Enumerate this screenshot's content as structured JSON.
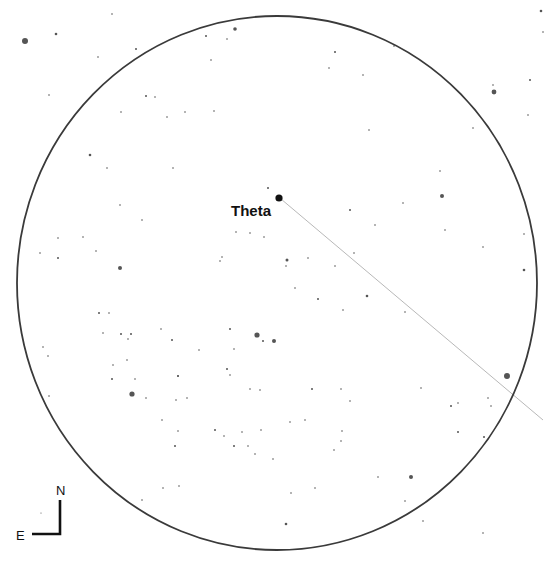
{
  "chart": {
    "background": "#ffffff",
    "field_of_view": {
      "cx": 277,
      "cy": 283,
      "rx": 260,
      "ry": 267,
      "stroke": "#3a3a3a",
      "stroke_width": 1.8
    },
    "path_line": {
      "x1": 281,
      "y1": 199,
      "x2": 543,
      "y2": 420,
      "stroke": "#b8b8b8",
      "stroke_width": 1
    },
    "target": {
      "name": "Theta",
      "x": 279,
      "y": 198,
      "r": 3.6,
      "label_x": 231,
      "label_y": 216,
      "font_size": 15
    },
    "compass": {
      "north_label": "N",
      "east_label": "E",
      "corner_x": 60,
      "corner_y": 534,
      "north_tip_y": 500,
      "east_tip_x": 32,
      "n_label_x": 61,
      "n_label_y": 495,
      "e_label_x": 20,
      "e_label_y": 540
    },
    "star_color": "#555555",
    "stars": [
      {
        "x": 25,
        "y": 41,
        "r": 3.0
      },
      {
        "x": 56,
        "y": 34,
        "r": 1.3
      },
      {
        "x": 235,
        "y": 29,
        "r": 1.8
      },
      {
        "x": 112,
        "y": 14,
        "r": 0.8
      },
      {
        "x": 206,
        "y": 36,
        "r": 1.0
      },
      {
        "x": 227,
        "y": 39,
        "r": 0.8
      },
      {
        "x": 136,
        "y": 49,
        "r": 1.0
      },
      {
        "x": 98,
        "y": 57,
        "r": 0.8
      },
      {
        "x": 211,
        "y": 60,
        "r": 0.8
      },
      {
        "x": 146,
        "y": 96,
        "r": 1.0
      },
      {
        "x": 155,
        "y": 97,
        "r": 0.8
      },
      {
        "x": 185,
        "y": 112,
        "r": 0.8
      },
      {
        "x": 167,
        "y": 117,
        "r": 0.8
      },
      {
        "x": 121,
        "y": 112,
        "r": 0.8
      },
      {
        "x": 214,
        "y": 111,
        "r": 0.8
      },
      {
        "x": 494,
        "y": 92,
        "r": 2.4
      },
      {
        "x": 541,
        "y": 11,
        "r": 1.3
      },
      {
        "x": 543,
        "y": 32,
        "r": 0.8
      },
      {
        "x": 394,
        "y": 46,
        "r": 0.8
      },
      {
        "x": 335,
        "y": 52,
        "r": 1.0
      },
      {
        "x": 329,
        "y": 68,
        "r": 0.8
      },
      {
        "x": 363,
        "y": 75,
        "r": 0.8
      },
      {
        "x": 530,
        "y": 80,
        "r": 1.0
      },
      {
        "x": 493,
        "y": 85,
        "r": 0.8
      },
      {
        "x": 369,
        "y": 130,
        "r": 0.8
      },
      {
        "x": 473,
        "y": 128,
        "r": 0.8
      },
      {
        "x": 528,
        "y": 115,
        "r": 0.8
      },
      {
        "x": 90,
        "y": 155,
        "r": 1.3
      },
      {
        "x": 107,
        "y": 168,
        "r": 0.8
      },
      {
        "x": 173,
        "y": 168,
        "r": 0.8
      },
      {
        "x": 120,
        "y": 205,
        "r": 0.8
      },
      {
        "x": 142,
        "y": 220,
        "r": 0.8
      },
      {
        "x": 58,
        "y": 238,
        "r": 0.8
      },
      {
        "x": 83,
        "y": 237,
        "r": 0.8
      },
      {
        "x": 96,
        "y": 251,
        "r": 0.8
      },
      {
        "x": 58,
        "y": 258,
        "r": 1.0
      },
      {
        "x": 120,
        "y": 268,
        "r": 2.0
      },
      {
        "x": 40,
        "y": 253,
        "r": 0.8
      },
      {
        "x": 442,
        "y": 196,
        "r": 2.0
      },
      {
        "x": 403,
        "y": 203,
        "r": 0.8
      },
      {
        "x": 445,
        "y": 230,
        "r": 0.8
      },
      {
        "x": 483,
        "y": 247,
        "r": 0.8
      },
      {
        "x": 524,
        "y": 270,
        "r": 1.3
      },
      {
        "x": 524,
        "y": 234,
        "r": 0.8
      },
      {
        "x": 440,
        "y": 171,
        "r": 0.8
      },
      {
        "x": 268,
        "y": 188,
        "r": 1.0
      },
      {
        "x": 270,
        "y": 214,
        "r": 0.8
      },
      {
        "x": 250,
        "y": 233,
        "r": 0.8
      },
      {
        "x": 236,
        "y": 232,
        "r": 0.8
      },
      {
        "x": 264,
        "y": 237,
        "r": 0.8
      },
      {
        "x": 222,
        "y": 257,
        "r": 0.8
      },
      {
        "x": 220,
        "y": 261,
        "r": 0.8
      },
      {
        "x": 287,
        "y": 260,
        "r": 1.5
      },
      {
        "x": 286,
        "y": 266,
        "r": 0.8
      },
      {
        "x": 308,
        "y": 258,
        "r": 0.8
      },
      {
        "x": 335,
        "y": 266,
        "r": 0.8
      },
      {
        "x": 350,
        "y": 210,
        "r": 1.0
      },
      {
        "x": 375,
        "y": 225,
        "r": 0.8
      },
      {
        "x": 354,
        "y": 253,
        "r": 0.8
      },
      {
        "x": 295,
        "y": 288,
        "r": 0.8
      },
      {
        "x": 318,
        "y": 299,
        "r": 1.0
      },
      {
        "x": 367,
        "y": 296,
        "r": 1.3
      },
      {
        "x": 343,
        "y": 310,
        "r": 0.8
      },
      {
        "x": 405,
        "y": 312,
        "r": 0.8
      },
      {
        "x": 257,
        "y": 335,
        "r": 2.6
      },
      {
        "x": 263,
        "y": 341,
        "r": 1.0
      },
      {
        "x": 274,
        "y": 341,
        "r": 2.0
      },
      {
        "x": 230,
        "y": 329,
        "r": 1.0
      },
      {
        "x": 234,
        "y": 349,
        "r": 0.8
      },
      {
        "x": 227,
        "y": 369,
        "r": 1.0
      },
      {
        "x": 99,
        "y": 313,
        "r": 1.0
      },
      {
        "x": 109,
        "y": 313,
        "r": 0.8
      },
      {
        "x": 103,
        "y": 333,
        "r": 0.8
      },
      {
        "x": 121,
        "y": 334,
        "r": 1.0
      },
      {
        "x": 131,
        "y": 334,
        "r": 1.0
      },
      {
        "x": 128,
        "y": 339,
        "r": 0.8
      },
      {
        "x": 161,
        "y": 329,
        "r": 0.8
      },
      {
        "x": 172,
        "y": 340,
        "r": 1.0
      },
      {
        "x": 178,
        "y": 376,
        "r": 1.0
      },
      {
        "x": 43,
        "y": 347,
        "r": 0.8
      },
      {
        "x": 48,
        "y": 356,
        "r": 0.8
      },
      {
        "x": 112,
        "y": 379,
        "r": 1.0
      },
      {
        "x": 135,
        "y": 379,
        "r": 0.8
      },
      {
        "x": 199,
        "y": 350,
        "r": 0.8
      },
      {
        "x": 132,
        "y": 394,
        "r": 2.6
      },
      {
        "x": 146,
        "y": 398,
        "r": 0.8
      },
      {
        "x": 49,
        "y": 396,
        "r": 0.8
      },
      {
        "x": 187,
        "y": 398,
        "r": 0.8
      },
      {
        "x": 176,
        "y": 400,
        "r": 0.8
      },
      {
        "x": 162,
        "y": 420,
        "r": 0.8
      },
      {
        "x": 507,
        "y": 376,
        "r": 3.0
      },
      {
        "x": 488,
        "y": 398,
        "r": 0.8
      },
      {
        "x": 451,
        "y": 406,
        "r": 1.0
      },
      {
        "x": 458,
        "y": 403,
        "r": 0.8
      },
      {
        "x": 491,
        "y": 406,
        "r": 0.8
      },
      {
        "x": 458,
        "y": 432,
        "r": 1.0
      },
      {
        "x": 421,
        "y": 388,
        "r": 0.8
      },
      {
        "x": 312,
        "y": 389,
        "r": 1.0
      },
      {
        "x": 230,
        "y": 375,
        "r": 0.8
      },
      {
        "x": 250,
        "y": 389,
        "r": 0.8
      },
      {
        "x": 260,
        "y": 390,
        "r": 0.8
      },
      {
        "x": 341,
        "y": 389,
        "r": 0.8
      },
      {
        "x": 350,
        "y": 401,
        "r": 0.8
      },
      {
        "x": 127,
        "y": 360,
        "r": 0.8
      },
      {
        "x": 113,
        "y": 365,
        "r": 0.8
      },
      {
        "x": 178,
        "y": 376,
        "r": 0.8
      },
      {
        "x": 242,
        "y": 432,
        "r": 0.8
      },
      {
        "x": 261,
        "y": 430,
        "r": 0.8
      },
      {
        "x": 178,
        "y": 431,
        "r": 0.8
      },
      {
        "x": 215,
        "y": 430,
        "r": 1.0
      },
      {
        "x": 341,
        "y": 441,
        "r": 0.8
      },
      {
        "x": 175,
        "y": 446,
        "r": 1.0
      },
      {
        "x": 224,
        "y": 436,
        "r": 0.8
      },
      {
        "x": 234,
        "y": 446,
        "r": 1.0
      },
      {
        "x": 248,
        "y": 446,
        "r": 0.8
      },
      {
        "x": 273,
        "y": 459,
        "r": 0.8
      },
      {
        "x": 342,
        "y": 431,
        "r": 0.8
      },
      {
        "x": 315,
        "y": 488,
        "r": 0.8
      },
      {
        "x": 378,
        "y": 477,
        "r": 0.8
      },
      {
        "x": 411,
        "y": 477,
        "r": 2.0
      },
      {
        "x": 484,
        "y": 437,
        "r": 1.0
      },
      {
        "x": 405,
        "y": 501,
        "r": 0.8
      },
      {
        "x": 423,
        "y": 521,
        "r": 0.8
      },
      {
        "x": 483,
        "y": 533,
        "r": 0.8
      },
      {
        "x": 179,
        "y": 486,
        "r": 0.8
      },
      {
        "x": 163,
        "y": 488,
        "r": 0.8
      },
      {
        "x": 291,
        "y": 493,
        "r": 0.8
      },
      {
        "x": 142,
        "y": 500,
        "r": 0.8
      },
      {
        "x": 286,
        "y": 524,
        "r": 1.3
      },
      {
        "x": 305,
        "y": 420,
        "r": 0.8
      },
      {
        "x": 290,
        "y": 422,
        "r": 0.8
      },
      {
        "x": 334,
        "y": 450,
        "r": 0.8
      },
      {
        "x": 255,
        "y": 454,
        "r": 0.8
      },
      {
        "x": 41,
        "y": 513,
        "r": 0.6
      },
      {
        "x": 49,
        "y": 95,
        "r": 0.8
      }
    ]
  }
}
